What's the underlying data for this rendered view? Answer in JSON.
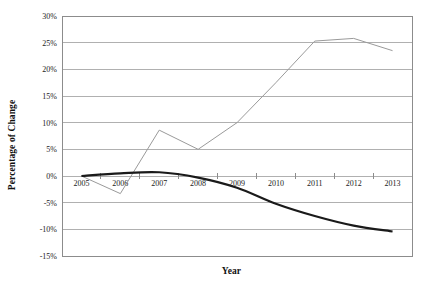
{
  "chart_data": {
    "type": "line",
    "title": "",
    "xlabel": "Year",
    "ylabel": "Percentage of Change",
    "categories": [
      "2005",
      "2006",
      "2007",
      "2008",
      "2009",
      "2010",
      "2011",
      "2012",
      "2013"
    ],
    "x": [
      2005,
      2006,
      2007,
      2008,
      2009,
      2010,
      2011,
      2012,
      2013
    ],
    "ylim": [
      -15,
      30
    ],
    "yticks": [
      30,
      25,
      20,
      15,
      10,
      5,
      0,
      -5,
      -10,
      -15
    ],
    "ytick_labels": [
      "30%",
      "25%",
      "20%",
      "15%",
      "10%",
      "5%",
      "0%",
      "-5%",
      "-10%",
      "-15%"
    ],
    "y_tick_step": 5,
    "y_unit": "%",
    "grid": "horizontal",
    "legend": "none",
    "series": [
      {
        "name": "series-1",
        "style": "straight",
        "color": "#9a9a9a",
        "line_width": 1,
        "values": [
          0,
          -3.3,
          8.6,
          5.0,
          10.0,
          17.5,
          25.3,
          25.8,
          23.5
        ]
      },
      {
        "name": "series-2",
        "style": "smoothed",
        "color": "#1a1a1a",
        "line_width": 2.2,
        "values": [
          0,
          0.5,
          0.7,
          -0.3,
          -2.2,
          -5.2,
          -7.5,
          -9.3,
          -10.4
        ]
      }
    ]
  },
  "axes": {
    "y_title": "Percentage of Change",
    "x_title": "Year"
  },
  "plot_area": {
    "left": 62,
    "top": 16,
    "right": 412,
    "bottom": 256
  },
  "colors": {
    "series_1": "#9a9a9a",
    "series_2": "#1a1a1a",
    "gridline": "#b0b0b0",
    "border": "#8c8c8c",
    "background": "#ffffff",
    "text": "#1a1a1a"
  }
}
